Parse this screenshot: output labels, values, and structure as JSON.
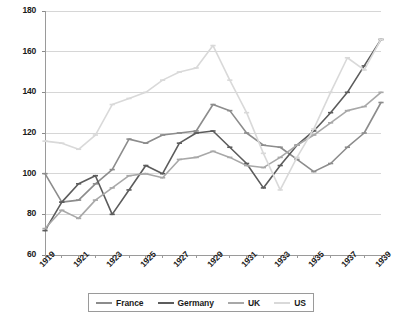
{
  "chart_data": {
    "type": "line",
    "title": "",
    "xlabel": "",
    "ylabel": "",
    "grid": true,
    "legend_position": "bottom",
    "x": [
      1919,
      1920,
      1921,
      1922,
      1923,
      1924,
      1925,
      1926,
      1927,
      1928,
      1929,
      1930,
      1931,
      1932,
      1933,
      1934,
      1935,
      1936,
      1937,
      1938,
      1939
    ],
    "xtick_labels": [
      "1919",
      "1921",
      "1923",
      "1925",
      "1927",
      "1929",
      "1931",
      "1933",
      "1935",
      "1937",
      "1939"
    ],
    "ytick_labels": [
      "60",
      "80",
      "100",
      "120",
      "140",
      "160",
      "180"
    ],
    "ylim": [
      60,
      180
    ],
    "xlim": [
      1919,
      1939
    ],
    "series": [
      {
        "name": "France",
        "color": "#8c8c8c",
        "values": [
          100,
          86,
          87,
          95,
          102,
          117,
          115,
          119,
          120,
          121,
          134,
          131,
          120,
          114,
          113,
          107,
          101,
          105,
          113,
          120,
          135
        ]
      },
      {
        "name": "Germany",
        "color": "#5c5c5c",
        "values": [
          72,
          86,
          95,
          99,
          80,
          92,
          104,
          100,
          115,
          120,
          121,
          113,
          105,
          93,
          104,
          114,
          121,
          130,
          140,
          153,
          166
        ]
      },
      {
        "name": "UK",
        "color": "#a8a8a8",
        "values": [
          73,
          82,
          78,
          87,
          93,
          99,
          100,
          98,
          107,
          108,
          111,
          108,
          104,
          103,
          108,
          114,
          119,
          125,
          131,
          133,
          140
        ]
      },
      {
        "name": "US",
        "color": "#d9d9d9",
        "values": [
          116,
          115,
          112,
          119,
          134,
          137,
          140,
          146,
          150,
          152,
          163,
          146,
          130,
          110,
          92,
          108,
          122,
          140,
          157,
          151,
          166
        ]
      }
    ]
  },
  "legend": {
    "entries": [
      {
        "label": "France"
      },
      {
        "label": "Germany"
      },
      {
        "label": "UK"
      },
      {
        "label": "US"
      }
    ]
  },
  "axes": {
    "y_min_label": "60",
    "y_max_label": "180",
    "x_min_label": "1919",
    "x_max_label": "1939"
  }
}
